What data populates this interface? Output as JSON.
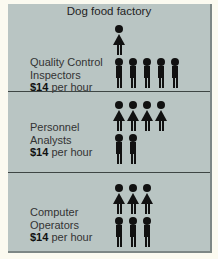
{
  "title": "Dog food factory",
  "groups": [
    {
      "line1": "Quality Control",
      "line2": "Inspectors",
      "wage": "$14",
      "unit": "per hour",
      "female": 1,
      "male": 5
    },
    {
      "line1": "Personnel",
      "line2": "Analysts",
      "wage": "$14",
      "unit": "per hour",
      "female": 4,
      "male": 2
    },
    {
      "line1": "Computer",
      "line2": "Operators",
      "wage": "$14",
      "unit": "per hour",
      "female": 3,
      "male": 3
    }
  ],
  "colors": {
    "panel": "#b9c5c3",
    "figure": "#111111",
    "divider": "#3e4644"
  }
}
